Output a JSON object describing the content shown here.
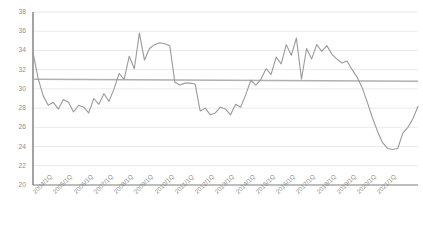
{
  "chart_data": {
    "type": "line",
    "title": "",
    "subtitle": "",
    "xlabel": "",
    "ylabel": "",
    "ylim": [
      20,
      38
    ],
    "ytick_step": 2,
    "grid": true,
    "legend": false,
    "legend_position": "none",
    "series_color": "#9a9a9a",
    "trend_color": "#b0b0b0",
    "grid_color": "#e4e4e4",
    "axis_color": "#7d7d7d",
    "ytick_labels": [
      "38",
      "36",
      "34",
      "32",
      "30",
      "28",
      "26",
      "24",
      "22",
      "20"
    ],
    "xtick_labels": [
      "2004/1Q",
      "2005/1Q",
      "2006/1Q",
      "2007/1Q",
      "2008/1Q",
      "2009/1Q",
      "2010/1Q",
      "2011/1Q",
      "2012/1Q",
      "2013/1Q",
      "2014/1Q",
      "2015/1Q",
      "2016/1Q",
      "2017/1Q",
      "2018/1Q",
      "2019/1Q",
      "2020/1Q",
      "2021/1Q"
    ],
    "x": [
      "2004/1Q",
      "2004/2Q",
      "2004/3Q",
      "2004/4Q",
      "2005/1Q",
      "2005/2Q",
      "2005/3Q",
      "2005/4Q",
      "2006/1Q",
      "2006/2Q",
      "2006/3Q",
      "2006/4Q",
      "2007/1Q",
      "2007/2Q",
      "2007/3Q",
      "2007/4Q",
      "2008/1Q",
      "2008/2Q",
      "2008/3Q",
      "2008/4Q",
      "2009/1Q",
      "2009/2Q",
      "2009/3Q",
      "2009/4Q",
      "2010/1Q",
      "2010/2Q",
      "2010/3Q",
      "2010/4Q",
      "2011/1Q",
      "2011/2Q",
      "2011/3Q",
      "2011/4Q",
      "2012/1Q",
      "2012/2Q",
      "2012/3Q",
      "2012/4Q",
      "2013/1Q",
      "2013/2Q",
      "2013/3Q",
      "2013/4Q",
      "2014/1Q",
      "2014/2Q",
      "2014/3Q",
      "2014/4Q",
      "2015/1Q",
      "2015/2Q",
      "2015/3Q",
      "2015/4Q",
      "2016/1Q",
      "2016/2Q",
      "2016/3Q",
      "2016/4Q",
      "2017/1Q",
      "2017/2Q",
      "2017/3Q",
      "2017/4Q",
      "2018/1Q",
      "2018/2Q",
      "2018/3Q",
      "2018/4Q",
      "2019/1Q",
      "2019/2Q",
      "2019/3Q",
      "2019/4Q",
      "2020/1Q",
      "2020/2Q",
      "2020/3Q",
      "2020/4Q",
      "2021/1Q",
      "2021/2Q"
    ],
    "values": [
      33.8,
      31.1,
      29.3,
      28.3,
      28.6,
      27.9,
      28.9,
      28.6,
      27.6,
      28.3,
      28.1,
      27.5,
      29.0,
      28.4,
      29.5,
      28.7,
      30.0,
      31.6,
      31.0,
      33.4,
      32.1,
      35.8,
      33.0,
      34.2,
      34.6,
      34.8,
      34.7,
      34.5,
      30.7,
      30.4,
      30.6,
      30.6,
      30.5,
      27.7,
      28.0,
      27.3,
      27.5,
      28.1,
      27.9,
      27.3,
      28.4,
      28.1,
      29.4,
      30.9,
      30.4,
      31.0,
      32.1,
      31.5,
      33.3,
      32.6,
      34.6,
      33.5,
      35.3,
      31.0,
      34.2,
      33.1,
      34.6,
      33.9,
      34.5,
      33.6,
      33.1,
      32.7,
      32.9,
      32.0,
      31.2,
      30.1,
      28.6,
      27.0,
      25.6,
      24.4
    ],
    "values_tail": [
      23.8,
      23.7,
      23.8,
      25.4,
      26.0,
      26.9,
      28.2
    ],
    "trend_line": {
      "label": "trend",
      "start_value": 31.0,
      "end_value": 30.8
    },
    "min_value": 23.7,
    "max_value": 35.8,
    "start_value": 33.8,
    "end_value": 28.2
  }
}
